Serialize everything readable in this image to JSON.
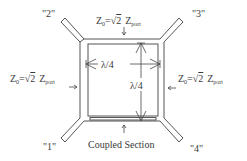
{
  "diagram": {
    "type": "branch-line hybrid coupler schematic",
    "ports": [
      {
        "id": "port-1",
        "label": "\"1\"",
        "position": "bottom-left"
      },
      {
        "id": "port-2",
        "label": "\"2\"",
        "position": "top-left"
      },
      {
        "id": "port-3",
        "label": "\"3\"",
        "position": "top-right"
      },
      {
        "id": "port-4",
        "label": "\"4\"",
        "position": "bottom-right"
      }
    ],
    "impedance_labels": {
      "top": {
        "z": "Z",
        "sub0": "0",
        "eq": "=",
        "sqrt": "√",
        "two": "2",
        "zport": "Z",
        "subport": "port"
      },
      "left": {
        "z": "Z",
        "sub0": "0",
        "eq": "=",
        "sqrt": "√",
        "two": "2",
        "zport": "Z",
        "subport": "port"
      },
      "right": {
        "z": "Z",
        "sub0": "0",
        "eq": "=",
        "sqrt": "√",
        "two": "2",
        "zport": "Z",
        "subport": "port"
      }
    },
    "dimensions": {
      "horizontal": "λ/4",
      "vertical": "λ/4"
    },
    "coupled_section_label": "Coupled Section"
  }
}
